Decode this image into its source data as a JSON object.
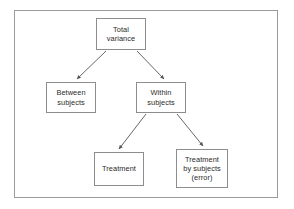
{
  "diagram": {
    "frame": {
      "x": 14,
      "y": 10,
      "width": 264,
      "height": 188,
      "border_color": "#9a9a9a"
    },
    "style": {
      "box_border_color": "#8d8d8d",
      "box_fill": "#ffffff",
      "text_color": "#2b2b2b",
      "arrow_color": "#555555",
      "background": "#ffffff"
    },
    "nodes": [
      {
        "id": "total-variance",
        "label": "Total\nvariance",
        "lines": [
          "Total",
          "variance"
        ],
        "x": 96,
        "y": 18,
        "width": 50,
        "height": 32
      },
      {
        "id": "between-subjects",
        "label": "Between\nsubjects",
        "lines": [
          "Between",
          "subjects"
        ],
        "x": 46,
        "y": 82,
        "width": 50,
        "height": 31
      },
      {
        "id": "within-subjects",
        "label": "Within\nsubjects",
        "lines": [
          "Within",
          "subjects"
        ],
        "x": 136,
        "y": 82,
        "width": 50,
        "height": 31
      },
      {
        "id": "treatment",
        "label": "Treatment",
        "lines": [
          "Treatment"
        ],
        "x": 94,
        "y": 152,
        "width": 50,
        "height": 34
      },
      {
        "id": "treatment-by-subjects-error",
        "label": "Treatment\nby subjects\n(error)",
        "lines": [
          "Treatment",
          "by subjects",
          "(error)"
        ],
        "x": 176,
        "y": 149,
        "width": 52,
        "height": 39
      }
    ],
    "edges": [
      {
        "id": "edge-total-to-between",
        "from": "total-variance",
        "to": "between-subjects",
        "x1": 106,
        "y1": 51,
        "x2": 77,
        "y2": 79
      },
      {
        "id": "edge-total-to-within",
        "from": "total-variance",
        "to": "within-subjects",
        "x1": 137,
        "y1": 51,
        "x2": 164,
        "y2": 79
      },
      {
        "id": "edge-within-to-treatment",
        "from": "within-subjects",
        "to": "treatment",
        "x1": 146,
        "y1": 114,
        "x2": 119,
        "y2": 149
      },
      {
        "id": "edge-within-to-error",
        "from": "within-subjects",
        "to": "treatment-by-subjects-error",
        "x1": 177,
        "y1": 114,
        "x2": 203,
        "y2": 146
      }
    ]
  }
}
